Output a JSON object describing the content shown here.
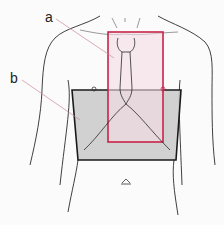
{
  "figure": {
    "labels": {
      "a": "a",
      "b": "b"
    },
    "colors": {
      "region_a_stroke": "#c8234a",
      "region_a_fill": "#f3dce2",
      "region_b_stroke": "#1a1a1a",
      "region_b_fill": "#c9c9c9",
      "outline": "#2a2a2a",
      "leader_line": "#c88a96"
    },
    "region_a": {
      "x": 108,
      "y": 32,
      "width": 55,
      "height": 110
    },
    "region_b": {
      "top_left": [
        72,
        90
      ],
      "top_right": [
        181,
        90
      ],
      "bottom_right": [
        176,
        160
      ],
      "bottom_left": [
        78,
        160
      ]
    }
  }
}
